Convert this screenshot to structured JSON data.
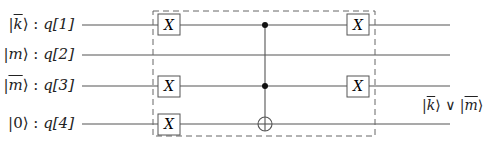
{
  "diagram": {
    "type": "quantum-circuit",
    "qubits": [
      {
        "id": "q1",
        "state": "k̄",
        "register": "q[1]",
        "y": 25
      },
      {
        "id": "q2",
        "state": "m",
        "register": "q[2]",
        "y": 55
      },
      {
        "id": "q3",
        "state": "m̄",
        "register": "q[3]",
        "y": 86
      },
      {
        "id": "q4",
        "state": "0",
        "register": "q[4]",
        "y": 124
      }
    ],
    "labels": {
      "q1": {
        "ket_open": "|",
        "ket_body": "k",
        "ket_close": "⟩",
        "sep": " : ",
        "reg": "q[1]"
      },
      "q2": {
        "ket_open": "|",
        "ket_body": "m",
        "ket_close": "⟩",
        "sep": " : ",
        "reg": "q[2]"
      },
      "q3": {
        "ket_open": "|",
        "ket_body": "m",
        "ket_close": "⟩",
        "sep": " : ",
        "reg": "q[3]"
      },
      "q4": {
        "ket_open": "|",
        "ket_body": "0",
        "ket_close": "⟩",
        "sep": " : ",
        "reg": "q[4]"
      }
    },
    "gates": [
      {
        "type": "X",
        "qubit": "q1",
        "column": 1,
        "label": "X"
      },
      {
        "type": "X",
        "qubit": "q3",
        "column": 1,
        "label": "X"
      },
      {
        "type": "X",
        "qubit": "q4",
        "column": 1,
        "label": "X"
      },
      {
        "type": "Toffoli",
        "controls": [
          "q1",
          "q3"
        ],
        "target": "q4",
        "column": 2
      },
      {
        "type": "X",
        "qubit": "q1",
        "column": 3,
        "label": "X"
      },
      {
        "type": "X",
        "qubit": "q3",
        "column": 3,
        "label": "X"
      }
    ],
    "grouping": {
      "style": "dashed-box",
      "spans_columns": [
        1,
        3
      ]
    },
    "output": {
      "k_part": "k",
      "or_symbol": "∨",
      "m_part": "m",
      "ket_open": "|",
      "ket_close": "⟩"
    }
  }
}
